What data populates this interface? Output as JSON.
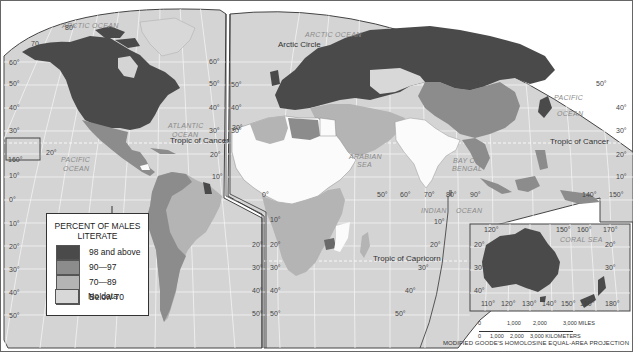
{
  "map": {
    "title": "Percent of Males Literate",
    "projection": "MODIFIED GOODE'S HOMOLOSINE EQUAL-AREA PROJECTION",
    "colors": {
      "ocean": "#d4d4d4",
      "grid": "#f2f2f2",
      "cat_98_above": "#4a4a4a",
      "cat_90_97": "#8c8c8c",
      "cat_70_89": "#b4b4b4",
      "cat_below_70": "#fbfbfb",
      "cat_no_data": "#d8d8d8",
      "border": "#333333"
    },
    "ocean_labels": [
      {
        "text": "ARCTIC OCEAN",
        "x": 62,
        "y": 28
      },
      {
        "text": "ATLANTIC",
        "x": 168,
        "y": 128
      },
      {
        "text": "OCEAN",
        "x": 172,
        "y": 137
      },
      {
        "text": "PACIFIC",
        "x": 61,
        "y": 162
      },
      {
        "text": "OCEAN",
        "x": 63,
        "y": 171
      },
      {
        "text": "ARCTIC OCEAN",
        "x": 305,
        "y": 37
      },
      {
        "text": "PACIFIC",
        "x": 554,
        "y": 100
      },
      {
        "text": "OCEAN",
        "x": 557,
        "y": 116
      },
      {
        "text": "ARABIAN",
        "x": 349,
        "y": 159
      },
      {
        "text": "SEA",
        "x": 357,
        "y": 167
      },
      {
        "text": "BAY OF",
        "x": 453,
        "y": 163
      },
      {
        "text": "BENGAL",
        "x": 452,
        "y": 171
      },
      {
        "text": "INDIAN",
        "x": 421,
        "y": 213
      },
      {
        "text": "OCEAN",
        "x": 456,
        "y": 213
      },
      {
        "text": "CORAL SEA",
        "x": 560,
        "y": 242
      }
    ],
    "feature_labels": [
      {
        "text": "Arctic Circle",
        "x": 278,
        "y": 47
      },
      {
        "text": "Tropic of Cancer",
        "x": 170,
        "y": 143
      },
      {
        "text": "Tropic of Cancer",
        "x": 550,
        "y": 144
      },
      {
        "text": "Tropic of Capricorn",
        "x": 373,
        "y": 261
      }
    ],
    "latitude_labels": [
      {
        "text": "80°",
        "x": 65,
        "y": 30
      },
      {
        "text": "70",
        "x": 31,
        "y": 46
      },
      {
        "text": "60°",
        "x": 9,
        "y": 65
      },
      {
        "text": "50°",
        "x": 9,
        "y": 86
      },
      {
        "text": "40°",
        "x": 9,
        "y": 110
      },
      {
        "text": "30°",
        "x": 9,
        "y": 133
      },
      {
        "text": "20°",
        "x": 46,
        "y": 155
      },
      {
        "text": "160°",
        "x": 8,
        "y": 162
      },
      {
        "text": "10°",
        "x": 9,
        "y": 178
      },
      {
        "text": "0°",
        "x": 9,
        "y": 202
      },
      {
        "text": "10°",
        "x": 9,
        "y": 226
      },
      {
        "text": "20°",
        "x": 9,
        "y": 249
      },
      {
        "text": "30°",
        "x": 9,
        "y": 272
      },
      {
        "text": "40°",
        "x": 9,
        "y": 295
      },
      {
        "text": "50°",
        "x": 9,
        "y": 318
      },
      {
        "text": "60°",
        "x": 209,
        "y": 64
      },
      {
        "text": "50°",
        "x": 209,
        "y": 86
      },
      {
        "text": "40°",
        "x": 209,
        "y": 110
      },
      {
        "text": "30°",
        "x": 209,
        "y": 133
      },
      {
        "text": "20°",
        "x": 210,
        "y": 157
      },
      {
        "text": "10°",
        "x": 212,
        "y": 179
      },
      {
        "text": "20°",
        "x": 252,
        "y": 247
      },
      {
        "text": "30°",
        "x": 252,
        "y": 270
      },
      {
        "text": "40°",
        "x": 252,
        "y": 293
      },
      {
        "text": "50°",
        "x": 252,
        "y": 316
      },
      {
        "text": "50°",
        "x": 231,
        "y": 87
      },
      {
        "text": "40°",
        "x": 231,
        "y": 110
      },
      {
        "text": "30°",
        "x": 231,
        "y": 133
      },
      {
        "text": "30°",
        "x": 232,
        "y": 130
      },
      {
        "text": "0°",
        "x": 262,
        "y": 197
      },
      {
        "text": "10°",
        "x": 270,
        "y": 222
      },
      {
        "text": "20°",
        "x": 270,
        "y": 247
      },
      {
        "text": "30°",
        "x": 270,
        "y": 270
      },
      {
        "text": "40°",
        "x": 270,
        "y": 293
      },
      {
        "text": "50°",
        "x": 270,
        "y": 316
      },
      {
        "text": "50°",
        "x": 377,
        "y": 197
      },
      {
        "text": "60°",
        "x": 400,
        "y": 197
      },
      {
        "text": "70°",
        "x": 424,
        "y": 197
      },
      {
        "text": "80°",
        "x": 446,
        "y": 197
      },
      {
        "text": "90°",
        "x": 470,
        "y": 197
      },
      {
        "text": "10°",
        "x": 434,
        "y": 224
      },
      {
        "text": "20°",
        "x": 430,
        "y": 247
      },
      {
        "text": "30°",
        "x": 418,
        "y": 270
      },
      {
        "text": "40°",
        "x": 405,
        "y": 293
      },
      {
        "text": "50°",
        "x": 395,
        "y": 316
      },
      {
        "text": "50°",
        "x": 596,
        "y": 86
      },
      {
        "text": "40°",
        "x": 616,
        "y": 110
      },
      {
        "text": "30°",
        "x": 616,
        "y": 133
      },
      {
        "text": "20°",
        "x": 616,
        "y": 157
      },
      {
        "text": "10°",
        "x": 616,
        "y": 179
      },
      {
        "text": "140°",
        "x": 582,
        "y": 197
      },
      {
        "text": "150°",
        "x": 609,
        "y": 197
      },
      {
        "text": "120°",
        "x": 484,
        "y": 232
      },
      {
        "text": "150°",
        "x": 556,
        "y": 232
      },
      {
        "text": "160°",
        "x": 577,
        "y": 232
      },
      {
        "text": "170°",
        "x": 603,
        "y": 232
      },
      {
        "text": "20°",
        "x": 474,
        "y": 247
      },
      {
        "text": "20°",
        "x": 605,
        "y": 247
      },
      {
        "text": "30°",
        "x": 474,
        "y": 270
      },
      {
        "text": "30°",
        "x": 605,
        "y": 270
      },
      {
        "text": "40°",
        "x": 474,
        "y": 293
      },
      {
        "text": "110°",
        "x": 481,
        "y": 306
      },
      {
        "text": "120°",
        "x": 501,
        "y": 306
      },
      {
        "text": "130°",
        "x": 522,
        "y": 306
      },
      {
        "text": "140°",
        "x": 542,
        "y": 306
      },
      {
        "text": "150°",
        "x": 561,
        "y": 306
      },
      {
        "text": "160°",
        "x": 580,
        "y": 306
      },
      {
        "text": "180°",
        "x": 605,
        "y": 306
      }
    ]
  },
  "legend": {
    "title_line1": "PERCENT OF MALES",
    "title_line2": "LITERATE",
    "items": [
      {
        "label": "98 and above",
        "color": "#4a4a4a"
      },
      {
        "label": "90—97",
        "color": "#8c8c8c"
      },
      {
        "label": "70—89",
        "color": "#b4b4b4"
      },
      {
        "label": "Below 70",
        "color": "#fbfbfb"
      },
      {
        "label": "No data",
        "color": "#d8d8d8"
      }
    ]
  },
  "scale": {
    "miles_ticks": [
      "0",
      "1,000",
      "2,000",
      "3,000 MILES"
    ],
    "km_ticks": [
      "0",
      "1,000",
      "2,000",
      "3,000 KILOMETERS"
    ]
  },
  "chart_data": {
    "type": "choropleth",
    "title": "PERCENT OF MALES LITERATE",
    "categories": [
      "98 and above",
      "90—97",
      "70—89",
      "Below 70",
      "No data"
    ],
    "regions": {
      "98 and above": [
        "United States",
        "Canada",
        "Europe",
        "Russia",
        "Japan",
        "Australia",
        "New Zealand",
        "Guyana",
        "Zimbabwe"
      ],
      "90—97": [
        "Mexico",
        "Central America",
        "Venezuela",
        "Colombia",
        "Peru",
        "Bolivia",
        "Chile",
        "Argentina",
        "China",
        "Libya",
        "Southeast Asia",
        "Indonesia",
        "Philippines"
      ],
      "70—89": [
        "Brazil",
        "Algeria",
        "Middle East",
        "Southern Africa",
        "East Africa",
        "Iran",
        "Turkey"
      ],
      "Below 70": [
        "India",
        "Sahel",
        "Sudan",
        "Ethiopia",
        "Mozambique",
        "Pakistan",
        "Nepal",
        "Bangladesh"
      ],
      "No data": [
        "Greenland",
        "Mongolia"
      ]
    }
  }
}
